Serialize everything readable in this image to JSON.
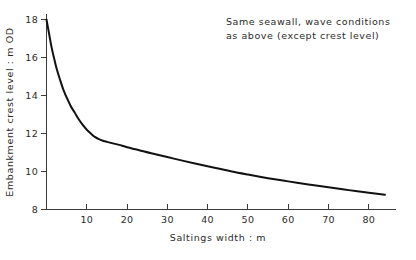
{
  "chart_data": {
    "type": "line",
    "title": "",
    "xlabel": "Saltings width : m",
    "ylabel": "Embankment crest level : m OD",
    "xlim": [
      0,
      85
    ],
    "ylim": [
      8,
      18
    ],
    "grid": false,
    "legend": null,
    "xticks": [
      10,
      20,
      30,
      40,
      50,
      60,
      70,
      80
    ],
    "xtick_labels": [
      "10",
      "20",
      "30",
      "40",
      "50",
      "60",
      "70",
      "80"
    ],
    "yticks": [
      8,
      10,
      12,
      14,
      16,
      18
    ],
    "ytick_labels": [
      "8",
      "10",
      "12",
      "14",
      "16",
      "18"
    ],
    "annotations": [
      {
        "name": "condition-note",
        "line1": "Same seawall, wave conditions",
        "line2": "as above (except crest level)",
        "x": 40,
        "y": 17.5
      }
    ],
    "series": [
      {
        "name": "Embankment crest level vs saltings width",
        "color": "#111111",
        "x": [
          0.0,
          0.6,
          1.2,
          1.9,
          2.6,
          3.4,
          4.2,
          5.1,
          6.0,
          7.0,
          8.0,
          9.0,
          10.0,
          11.0,
          12.0,
          13.0,
          14.0,
          15.0,
          16.5,
          18.0,
          20.0,
          23.0,
          26.0,
          30.0,
          34.0,
          38.0,
          42.0,
          46.0,
          50.0,
          55.0,
          60.0,
          65.0,
          70.0,
          75.0,
          80.0,
          84.0
        ],
        "y": [
          18.0,
          17.3,
          16.6,
          15.95,
          15.35,
          14.8,
          14.3,
          13.85,
          13.45,
          13.1,
          12.75,
          12.45,
          12.2,
          12.0,
          11.82,
          11.7,
          11.62,
          11.56,
          11.48,
          11.4,
          11.28,
          11.12,
          10.96,
          10.76,
          10.56,
          10.37,
          10.18,
          10.0,
          9.84,
          9.65,
          9.48,
          9.32,
          9.17,
          9.02,
          8.88,
          8.78
        ]
      }
    ]
  },
  "figure": {
    "background_color": "#ffffff",
    "axis_color": "#3a3a3a",
    "curve_color": "#111111"
  }
}
